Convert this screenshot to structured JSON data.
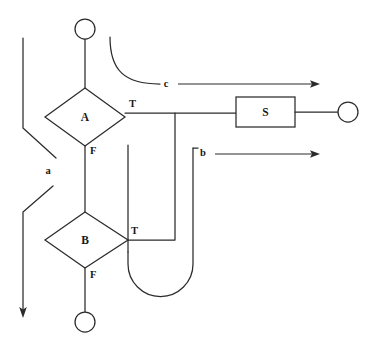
{
  "diagram": {
    "type": "flowchart",
    "title": "",
    "background_color": "#ffffff",
    "line_color": "#2b2b2b",
    "nodes": [
      {
        "id": "start",
        "kind": "circle-terminal",
        "label": "",
        "cx": 85,
        "cy": 29,
        "r": 10
      },
      {
        "id": "A",
        "kind": "decision-diamond",
        "label": "A",
        "cx": 85,
        "cy": 117,
        "rx": 40,
        "ry": 29
      },
      {
        "id": "B",
        "kind": "decision-diamond",
        "label": "B",
        "cx": 85,
        "cy": 240,
        "rx": 40,
        "ry": 28
      },
      {
        "id": "S",
        "kind": "process-rect",
        "label": "S",
        "x": 236,
        "y": 97,
        "w": 59,
        "h": 30
      },
      {
        "id": "end_right",
        "kind": "circle-terminal",
        "label": "",
        "cx": 348,
        "cy": 112,
        "r": 10
      },
      {
        "id": "end_bottom",
        "kind": "circle-terminal",
        "label": "",
        "cx": 85,
        "cy": 322,
        "r": 10
      }
    ],
    "branch_labels": [
      {
        "id": "A-true",
        "text": "T",
        "x": 129,
        "y": 105
      },
      {
        "id": "A-false",
        "text": "F",
        "x": 90,
        "y": 152
      },
      {
        "id": "B-true",
        "text": "T",
        "x": 131,
        "y": 232
      },
      {
        "id": "B-false",
        "text": "F",
        "x": 90,
        "y": 276
      }
    ],
    "edge_labels": [
      {
        "id": "label-a",
        "text": "a",
        "x": 48,
        "y": 172
      },
      {
        "id": "label-b",
        "text": "b",
        "x": 203,
        "y": 153
      },
      {
        "id": "label-c",
        "text": "c",
        "x": 166,
        "y": 84
      }
    ],
    "arrows": [
      {
        "id": "arrow-c",
        "from_x": 178,
        "from_y": 84,
        "to_x": 320,
        "to_y": 84
      },
      {
        "id": "arrow-b",
        "from_x": 215,
        "from_y": 154,
        "to_x": 320,
        "to_y": 154
      },
      {
        "id": "arrow-a",
        "from_x": 23,
        "from_y": 210,
        "to_x": 23,
        "to_y": 318
      }
    ]
  }
}
